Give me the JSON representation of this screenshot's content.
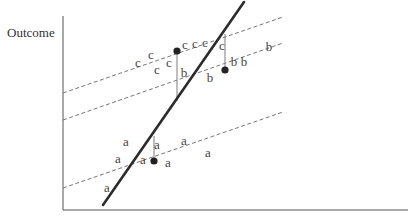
{
  "diagram": {
    "y_axis_label": "Outcome",
    "x_axis_label": "",
    "groups": [
      {
        "name": "a",
        "letter": "a",
        "points": [
          [
            126,
            141
          ],
          [
            118,
            158
          ],
          [
            143,
            159
          ],
          [
            157,
            144
          ],
          [
            184,
            140
          ],
          [
            208,
            152
          ],
          [
            168,
            162
          ],
          [
            107,
            187
          ]
        ],
        "group_line": {
          "style": "dashed",
          "from": [
            63,
            188
          ],
          "to": [
            283,
            112
          ]
        },
        "mean_dot": [
          154,
          161
        ],
        "residual_to": [
          154,
          136
        ]
      },
      {
        "name": "b",
        "letter": "b",
        "points": [
          [
            184,
            72
          ],
          [
            210,
            77
          ],
          [
            234,
            61
          ],
          [
            244,
            61
          ],
          [
            269,
            46
          ]
        ],
        "group_line": {
          "style": "dashed",
          "from": [
            63,
            120
          ],
          "to": [
            283,
            43
          ]
        },
        "mean_dot": [
          225,
          70
        ],
        "residual_to": [
          225,
          34
        ]
      },
      {
        "name": "c",
        "letter": "c",
        "points": [
          [
            138,
            62
          ],
          [
            151,
            54
          ],
          [
            157,
            69
          ],
          [
            169,
            62
          ],
          [
            185,
            44
          ],
          [
            195,
            43
          ],
          [
            205,
            42
          ],
          [
            222,
            45
          ]
        ],
        "group_line": {
          "style": "dashed",
          "from": [
            63,
            93
          ],
          "to": [
            283,
            17
          ]
        },
        "mean_dot": [
          177,
          51
        ],
        "residual_to": [
          177,
          101
        ]
      }
    ],
    "overall_line": {
      "style": "bold",
      "from": [
        103,
        205
      ],
      "to": [
        244,
        2
      ]
    },
    "colors": {
      "axis": "#555555",
      "dashed": "#777777",
      "bold": "#2b2b2b",
      "text": "#444444",
      "dot": "#222222"
    }
  }
}
